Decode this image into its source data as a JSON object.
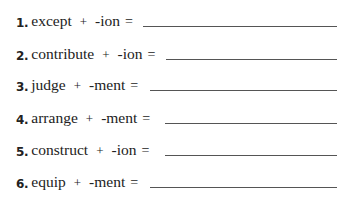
{
  "exercise": {
    "items": [
      {
        "number": "1.",
        "word": "except",
        "operator": "+",
        "suffix": "-ion",
        "equals": "=",
        "answer": ""
      },
      {
        "number": "2.",
        "word": "contribute",
        "operator": "+",
        "suffix": "-ion",
        "equals": "=",
        "answer": ""
      },
      {
        "number": "3.",
        "word": "judge",
        "operator": "+",
        "suffix": "-ment",
        "equals": "=",
        "answer": ""
      },
      {
        "number": "4.",
        "word": "arrange",
        "operator": "+",
        "suffix": "-ment",
        "equals": "=",
        "answer": ""
      },
      {
        "number": "5.",
        "word": "construct",
        "operator": "+",
        "suffix": "-ion",
        "equals": "=",
        "answer": ""
      },
      {
        "number": "6.",
        "word": "equip",
        "operator": "+",
        "suffix": "-ment",
        "equals": "=",
        "answer": ""
      }
    ]
  }
}
